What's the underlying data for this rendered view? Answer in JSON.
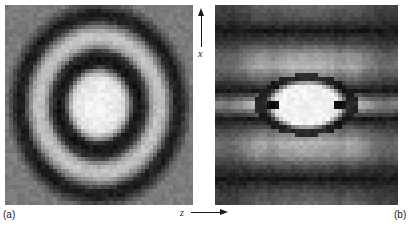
{
  "figure": {
    "background_color": "#ffffff",
    "axes": {
      "vertical": {
        "letter": "x",
        "arrow": "arrow-up-icon",
        "direction": "up"
      },
      "horizontal": {
        "letter": "z",
        "arrow": "arrow-right-icon",
        "direction": "right"
      }
    },
    "panels": [
      {
        "id": "a",
        "caption": "(a)",
        "x": 5,
        "y": 5,
        "width": 188,
        "height": 200
      },
      {
        "id": "b",
        "caption": "(b)",
        "x": 215,
        "y": 5,
        "width": 183,
        "height": 200
      }
    ]
  },
  "chart_data": [
    {
      "type": "heatmap",
      "title": "",
      "panel": "a",
      "xlabel": "z",
      "ylabel": "x",
      "colormap": "grayscale",
      "description": "Circularly symmetric pixelated intensity distribution: bright central disk, surrounded by a dark ring, a light ring, a second dark ring, fading to mid gray at the corners.",
      "grid": false,
      "legend": null,
      "nx": 47,
      "ny": 50,
      "value_range": [
        0,
        1
      ],
      "radial_profile": {
        "r_normalized": [
          0.0,
          0.08,
          0.16,
          0.22,
          0.27,
          0.32,
          0.37,
          0.43,
          0.5,
          0.56,
          0.62,
          0.68,
          0.74,
          0.8,
          0.87,
          0.94,
          1.0
        ],
        "intensity": [
          0.95,
          0.95,
          0.94,
          0.92,
          0.86,
          0.55,
          0.12,
          0.06,
          0.2,
          0.62,
          0.78,
          0.74,
          0.48,
          0.13,
          0.09,
          0.3,
          0.48
        ]
      },
      "features": {
        "center_disk_radius_norm": 0.3,
        "center_intensity": 0.95,
        "dark_ring_1_radius_norm": 0.39,
        "dark_ring_1_intensity": 0.07,
        "light_ring_1_radius_norm": 0.63,
        "light_ring_1_intensity": 0.78,
        "dark_ring_2_radius_norm": 0.83,
        "dark_ring_2_intensity": 0.1,
        "corner_intensity": 0.48
      }
    },
    {
      "type": "heatmap",
      "title": "",
      "panel": "b",
      "xlabel": "z",
      "ylabel": "x",
      "colormap": "grayscale",
      "description": "Horizontally elongated pixelated intensity distribution: a bright elliptical core containing two small dark square spots on the z axis, bounded by a dark elliptical ring and flanked above and below by alternating light and dark horizontal bands.",
      "grid": false,
      "legend": null,
      "nx": 46,
      "ny": 50,
      "value_range": [
        0,
        1
      ],
      "profile_vertical_through_center": {
        "x_normalized": [
          -1.0,
          -0.86,
          -0.74,
          -0.62,
          -0.5,
          -0.38,
          -0.26,
          -0.14,
          0.0,
          0.14,
          0.26,
          0.38,
          0.5,
          0.62,
          0.74,
          0.86,
          1.0
        ],
        "intensity": [
          0.42,
          0.3,
          0.08,
          0.3,
          0.62,
          0.72,
          0.45,
          0.09,
          0.96,
          0.09,
          0.45,
          0.72,
          0.62,
          0.3,
          0.08,
          0.3,
          0.42
        ]
      },
      "profile_horizontal_through_center": {
        "z_normalized": [
          -1.0,
          -0.88,
          -0.76,
          -0.64,
          -0.54,
          -0.46,
          -0.38,
          -0.28,
          -0.16,
          0.0,
          0.16,
          0.28,
          0.38,
          0.46,
          0.54,
          0.64,
          0.76,
          0.88,
          1.0
        ],
        "intensity": [
          0.42,
          0.4,
          0.38,
          0.3,
          0.5,
          0.62,
          0.06,
          0.7,
          0.92,
          0.97,
          0.92,
          0.7,
          0.06,
          0.62,
          0.5,
          0.3,
          0.38,
          0.4,
          0.42
        ]
      },
      "features": {
        "core_semi_axis_z_norm": 0.36,
        "core_semi_axis_x_norm": 0.2,
        "core_intensity": 0.96,
        "dark_spot_positions_z_norm": [
          -0.38,
          0.38
        ],
        "dark_spot_intensity": 0.05,
        "dark_ring_intensity": 0.08,
        "side_band_light_intensity": 0.72,
        "side_band_dark_intensity": 0.08,
        "corner_intensity": 0.42
      }
    }
  ]
}
